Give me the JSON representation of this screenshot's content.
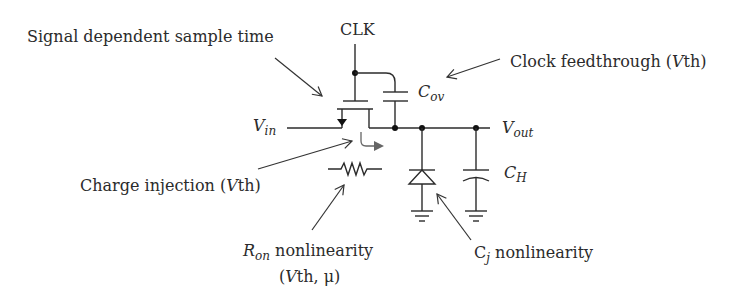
{
  "diagram": {
    "type": "sample-and-hold circuit error sources",
    "colors": {
      "line": "#2b2b2b",
      "background": "#ffffff",
      "injection_arrow": "#666666"
    },
    "nodes": {
      "clk": "CLK",
      "vin": {
        "main": "V",
        "sub": "in"
      },
      "vout": {
        "main": "V",
        "sub": "out"
      },
      "cov": {
        "main": "C",
        "sub": "ov"
      },
      "ch": {
        "main": "C",
        "sub": "H"
      }
    },
    "annotations": {
      "sample_time": "Signal dependent sample time",
      "clock_feedthrough": {
        "prefix": "Clock feedthrough (",
        "italic": "V",
        "suffix": "th)"
      },
      "charge_injection": {
        "prefix": "Charge injection (",
        "italic": "V",
        "suffix": "th)"
      },
      "ron": {
        "main": "R",
        "sub": "on",
        "rest": " nonlinearity",
        "line2_prefix": "(",
        "line2_italic": "V",
        "line2_suffix": "th, μ)"
      },
      "cj": {
        "main": "C",
        "sub": "j",
        "rest": " nonlinearity"
      }
    },
    "components": [
      "nmos-switch",
      "overlap-capacitor",
      "on-resistance",
      "junction-diode",
      "hold-capacitor",
      "ground",
      "ground"
    ]
  }
}
